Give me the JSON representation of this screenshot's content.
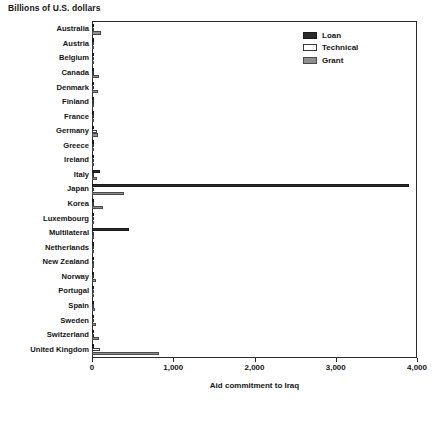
{
  "chart_data": {
    "type": "bar",
    "orientation": "horizontal",
    "title": "Billions of U.S. dollars",
    "xlabel": "Aid commitment to Iraq",
    "ylabel": "",
    "xlim": [
      0,
      4000
    ],
    "xticks": [
      0,
      1000,
      2000,
      3000,
      4000
    ],
    "xticklabels": [
      "0",
      "1,000",
      "2,000",
      "3,000",
      "4,000"
    ],
    "grid": false,
    "legend_position": "top-right-inside",
    "categories": [
      "Australia",
      "Austria",
      "Belgium",
      "Canada",
      "Denmark",
      "Finland",
      "France",
      "Germany",
      "Greece",
      "Ireland",
      "Italy",
      "Japan",
      "Korea",
      "Luxembourg",
      "Multilateral",
      "Netherlands",
      "New Zealand",
      "Norway",
      "Portugal",
      "Spain",
      "Sweden",
      "Switzerland",
      "United Kingdom"
    ],
    "series": [
      {
        "name": "Loan",
        "color": "#2a2a2a",
        "values": [
          8,
          0,
          5,
          6,
          0,
          0,
          18,
          6,
          0,
          3,
          95,
          3900,
          6,
          0,
          450,
          0,
          0,
          0,
          0,
          0,
          0,
          0,
          6
        ]
      },
      {
        "name": "Technical",
        "color": "#ffffff",
        "values": [
          20,
          4,
          3,
          22,
          4,
          4,
          6,
          56,
          2,
          4,
          22,
          20,
          14,
          2,
          18,
          5,
          4,
          6,
          4,
          14,
          5,
          16,
          96
        ]
      },
      {
        "name": "Grant",
        "color": "#8e8e8e",
        "values": [
          110,
          3,
          4,
          88,
          70,
          5,
          14,
          68,
          3,
          6,
          66,
          390,
          130,
          2,
          22,
          6,
          5,
          50,
          4,
          32,
          46,
          80,
          820
        ]
      }
    ]
  },
  "legend": {
    "entries": [
      {
        "label": "Loan",
        "swatch": "loan"
      },
      {
        "label": "Technical",
        "swatch": "technical"
      },
      {
        "label": "Grant",
        "swatch": "grant"
      }
    ]
  }
}
